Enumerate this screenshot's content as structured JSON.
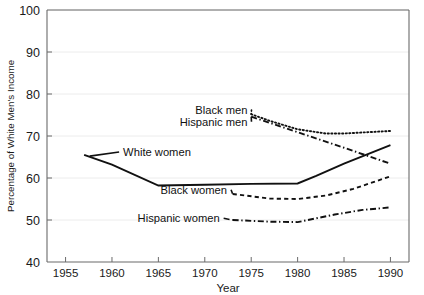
{
  "chart_data": {
    "type": "line",
    "title": "",
    "xlabel": "Year",
    "ylabel": "Percentage of White Men's Income",
    "xlim": [
      1953,
      1992
    ],
    "ylim": [
      40,
      100
    ],
    "xticks": [
      1955,
      1960,
      1965,
      1970,
      1975,
      1980,
      1985,
      1990
    ],
    "yticks": [
      40,
      50,
      60,
      70,
      80,
      90,
      100
    ],
    "grid": "horizontal",
    "legend": "inline-labels",
    "series": [
      {
        "name": "White women",
        "style": "solid",
        "label_x": 1961.2,
        "label_y": 66.2,
        "x": [
          1957,
          1960,
          1965,
          1970,
          1975,
          1980,
          1982,
          1985,
          1990
        ],
        "y": [
          65.5,
          63.2,
          58.2,
          58.4,
          58.6,
          58.7,
          60.5,
          63.4,
          67.8
        ]
      },
      {
        "name": "Black men",
        "style": "dotted",
        "label_x": 1974.6,
        "label_y": 76.2,
        "x": [
          1975,
          1977,
          1980,
          1983,
          1985,
          1990
        ],
        "y": [
          75.2,
          73.6,
          71.6,
          70.6,
          70.6,
          71.2
        ]
      },
      {
        "name": "Hispanic men",
        "style": "dashdot",
        "label_x": 1974.6,
        "label_y": 73.4,
        "x": [
          1975,
          1980,
          1985,
          1990
        ],
        "y": [
          74.6,
          70.9,
          67.2,
          63.4
        ]
      },
      {
        "name": "Black women",
        "style": "dashed",
        "label_x": 1972.4,
        "label_y": 57.2,
        "x": [
          1973,
          1977,
          1980,
          1983,
          1986,
          1990
        ],
        "y": [
          56.2,
          55.1,
          55.0,
          55.8,
          57.4,
          60.4
        ]
      },
      {
        "name": "Hispanic women",
        "style": "dashdot",
        "label_x": 1971.6,
        "label_y": 50.4,
        "x": [
          1973,
          1977,
          1980,
          1984,
          1987,
          1990
        ],
        "y": [
          50.0,
          49.6,
          49.5,
          51.3,
          52.4,
          53.0
        ]
      }
    ]
  },
  "source": {
    "note": ""
  }
}
